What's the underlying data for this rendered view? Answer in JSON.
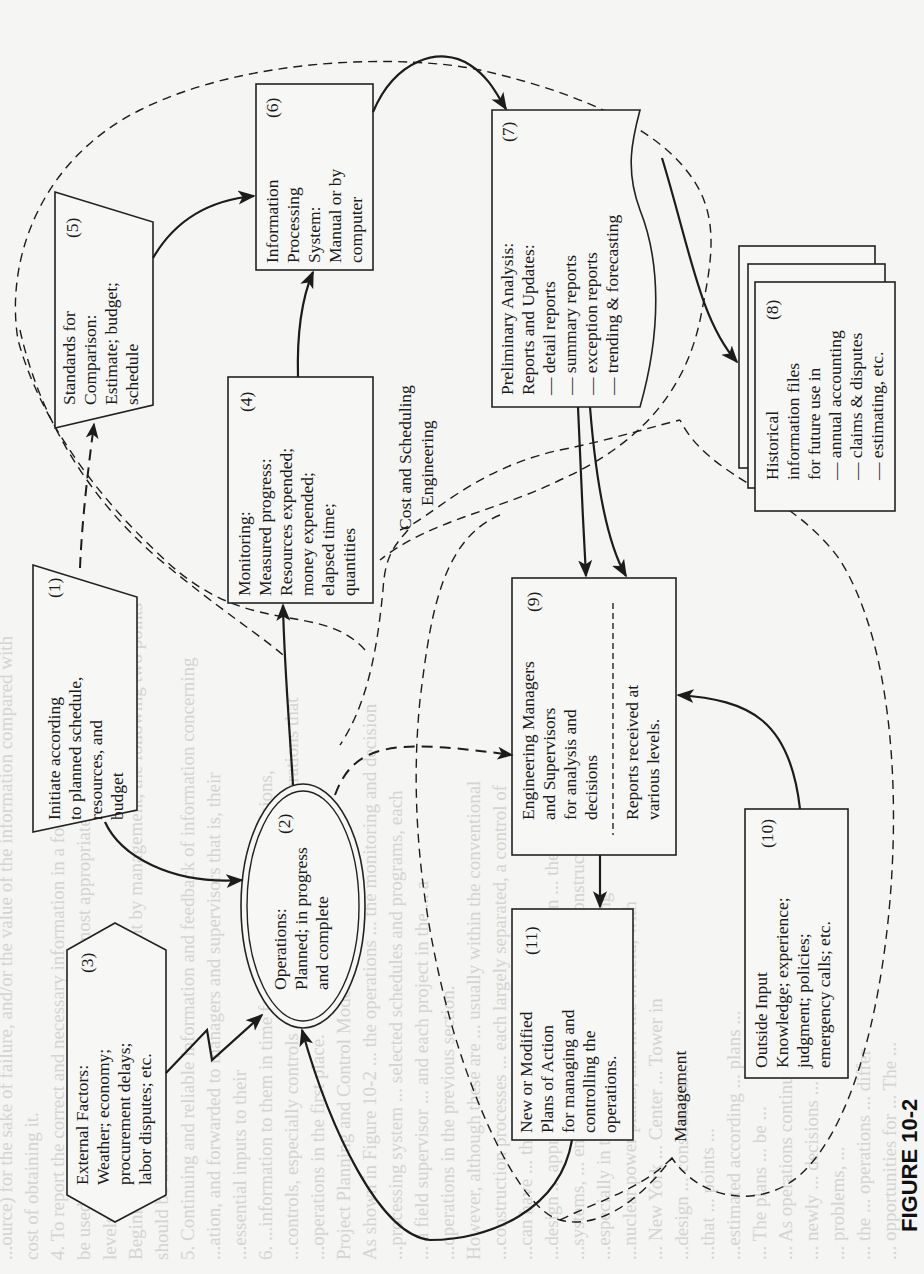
{
  "figure": {
    "caption": "FIGURE 10-2",
    "orientation": "rotated 90° counter-clockwise"
  },
  "nodes": {
    "n1": {
      "number": "(1)",
      "shape": "trapezoid",
      "lines": [
        "Initiate according",
        "to planned schedule,",
        "resources, and",
        "budget"
      ]
    },
    "n2": {
      "number": "(2)",
      "shape": "double-ellipse",
      "lines": [
        "Operations:",
        "Planned; in progress",
        "and complete"
      ]
    },
    "n3": {
      "number": "(3)",
      "shape": "hexagon",
      "lines": [
        "External Factors:",
        "Weather; economy;",
        "procurement delays;",
        "labor disputes; etc."
      ]
    },
    "n4": {
      "number": "(4)",
      "shape": "rectangle",
      "lines": [
        "Monitoring:",
        "Measured progress:",
        "Resources expended;",
        "money expended;",
        "elapsed time;",
        "quantities"
      ]
    },
    "n5": {
      "number": "(5)",
      "shape": "trapezoid",
      "lines": [
        "Standards for",
        "Comparison:",
        "Estimate; budget;",
        "schedule"
      ]
    },
    "n6": {
      "number": "(6)",
      "shape": "rectangle",
      "lines": [
        "Information",
        "Processing",
        "System:",
        "Manual or by",
        "computer"
      ]
    },
    "n7": {
      "number": "(7)",
      "shape": "document",
      "lines": [
        "Preliminary Analysis:",
        "Reports and Updates:",
        "— detail reports",
        "— summary reports",
        "— exception reports",
        "— trending & forecasting"
      ]
    },
    "n8": {
      "number": "(8)",
      "shape": "stacked-documents",
      "lines": [
        "Historical",
        "information files",
        "for future use in",
        "— annual accounting",
        "— claims & disputes",
        "— estimating, etc."
      ]
    },
    "n9": {
      "number": "(9)",
      "shape": "rectangle",
      "lines": [
        "Engineering Managers",
        "and Supervisors",
        "for analysis and",
        "decisions"
      ],
      "lines_below": [
        "Reports received at",
        "various levels."
      ]
    },
    "n10": {
      "number": "(10)",
      "shape": "rectangle",
      "lines": [
        "Outside Input",
        "Knowledge; experience;",
        "judgment; policies;",
        "emergency calls; etc."
      ]
    },
    "n11": {
      "number": "(11)",
      "shape": "rectangle",
      "lines": [
        "New or Modified",
        "Plans of Action",
        "for managing and",
        "controlling the",
        "operations."
      ]
    }
  },
  "regions": {
    "cost_scheduling": {
      "lines": [
        "Cost and Scheduling",
        "Engineering"
      ]
    },
    "management": {
      "lines": [
        "Management"
      ]
    }
  },
  "edges": [
    {
      "from": "n1",
      "to": "n2",
      "style": "solid"
    },
    {
      "from": "n1",
      "to": "n5",
      "style": "dashed"
    },
    {
      "from": "n2",
      "to": "n4",
      "style": "solid"
    },
    {
      "from": "n2",
      "to": "n9",
      "style": "dashed"
    },
    {
      "from": "n3",
      "to": "n2",
      "style": "zigzag"
    },
    {
      "from": "n4",
      "to": "n6",
      "style": "solid"
    },
    {
      "from": "n5",
      "to": "n6",
      "style": "solid"
    },
    {
      "from": "n6",
      "to": "n7",
      "style": "solid"
    },
    {
      "from": "n7",
      "to": "n9",
      "style": "solid"
    },
    {
      "from": "n7",
      "to": "n8",
      "style": "solid"
    },
    {
      "from": "n9",
      "to": "n11",
      "style": "solid"
    },
    {
      "from": "n10",
      "to": "n9",
      "style": "solid"
    },
    {
      "from": "n11",
      "to": "n2",
      "style": "solid"
    },
    {
      "from": "n8",
      "to": "n9",
      "style": "solid"
    }
  ],
  "bleed_through_text": [
    "...ource) for the sake of failure, and/or the value of the information compared with",
    "cost of obtaining it.",
    "4. To report the correct and necessary information in a form which can readily",
    "be used by management, and at intervals most appropriate for the individual",
    "levels of supervisors who will be using it.",
    "Beginning with the employees' commitment by management, the following two points",
    "should be added:",
    "5. Continuing and reliable information and feedback of information concerning",
    "...ation, and forwarded to managers and supervisors that is, their",
    "...essential inputs to their",
    "6. ...information to them in time for consideration and decisions,",
    "...controls, especially controls after must be taken on those operations that",
    "...operations in the first place.",
    "Project Planning and Control Model",
    "As shown in Figure 10-2 ... the operations ... the monitoring and decision",
    "...processing system ... selected schedules and programs, each",
    "... a field supervisor ... and each project in the ... a",
    "...operations in the previous section.",
    "However, although these are ... usually within the conventional",
    "...construction processes ... each largely separated, a control of",
    "...can have ... the ... total action ...",
    "...design ... approach ... is becoming ... between ... the",
    "...systems, ... engineering, procurement, and construction ... approach ...",
    "...especially in the ... projects, such as ... making",
    "...nuclear power plants, and in the ... field, with",
    "... New York ... Center ... Tower in",
    "...design ... construction ...",
    "...that ... points ...",
    "...estimated according ... plans ...",
    "... The plans ... be ...",
    "... As operations continue, ...",
    "... newly ... decisions ...",
    "... problems, ...",
    "... the ... operations ... differ",
    "... opportunities for ... The ..."
  ],
  "colors": {
    "paper": "#f5f5f3",
    "ink": "#1c1c1c",
    "bleed_text": "#d4d4d2"
  }
}
